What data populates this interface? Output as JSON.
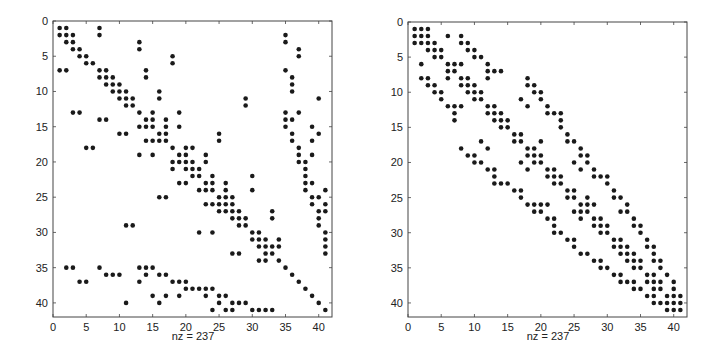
{
  "figure": {
    "background": "#ffffff",
    "ink_color": "#1a1a1a",
    "axis_color": "#444444"
  },
  "chart_data": [
    {
      "type": "scatter",
      "subtype": "sparsity-pattern (spy plot)",
      "title": "",
      "xlabel": "nz = 237",
      "ylabel": "",
      "xlim": [
        0,
        42
      ],
      "ylim": [
        42,
        0
      ],
      "xticks": [
        0,
        5,
        10,
        15,
        20,
        25,
        30,
        35,
        40
      ],
      "yticks": [
        0,
        5,
        10,
        15,
        20,
        25,
        30,
        35,
        40
      ],
      "grid": false,
      "nz": 237,
      "rows": {
        "1": [
          1,
          2,
          7
        ],
        "2": [
          1,
          2,
          3,
          7,
          35
        ],
        "3": [
          2,
          3,
          13,
          35
        ],
        "4": [
          3,
          4,
          13,
          37
        ],
        "5": [
          4,
          5,
          18,
          37
        ],
        "6": [
          5,
          6,
          18
        ],
        "7": [
          1,
          2,
          7,
          8,
          14,
          35
        ],
        "8": [
          7,
          8,
          9,
          14,
          36
        ],
        "9": [
          8,
          9,
          10,
          36
        ],
        "10": [
          9,
          10,
          11,
          16,
          36
        ],
        "11": [
          10,
          11,
          12,
          16,
          29,
          40
        ],
        "12": [
          11,
          12,
          29
        ],
        "13": [
          3,
          4,
          13,
          15,
          19,
          35,
          37
        ],
        "14": [
          7,
          8,
          14,
          15,
          17,
          35,
          36
        ],
        "15": [
          13,
          14,
          15,
          17,
          19,
          35,
          39
        ],
        "16": [
          10,
          11,
          16,
          17,
          25,
          36,
          40
        ],
        "17": [
          14,
          15,
          16,
          17,
          25,
          36,
          39
        ],
        "18": [
          5,
          6,
          18,
          20,
          21,
          37
        ],
        "19": [
          13,
          15,
          19,
          20,
          23,
          37,
          39
        ],
        "20": [
          18,
          19,
          20,
          21,
          23,
          37,
          38
        ],
        "21": [
          18,
          20,
          21,
          22,
          38
        ],
        "22": [
          21,
          22,
          24,
          30,
          38
        ],
        "23": [
          19,
          20,
          23,
          24,
          26,
          38,
          39
        ],
        "24": [
          22,
          23,
          24,
          26,
          30,
          38,
          41
        ],
        "25": [
          16,
          17,
          25,
          26,
          27,
          39,
          40
        ],
        "26": [
          23,
          24,
          25,
          26,
          27,
          39,
          41
        ],
        "27": [
          25,
          26,
          27,
          28,
          33,
          40,
          41
        ],
        "28": [
          27,
          28,
          29,
          33,
          40
        ],
        "29": [
          11,
          12,
          28,
          29,
          40
        ],
        "30": [
          22,
          24,
          30,
          31,
          41
        ],
        "31": [
          30,
          31,
          32,
          34,
          41
        ],
        "32": [
          31,
          32,
          33,
          34,
          41
        ],
        "33": [
          27,
          28,
          32,
          33,
          41
        ],
        "34": [
          31,
          32,
          34
        ],
        "35": [
          2,
          3,
          7,
          13,
          14,
          15,
          35
        ],
        "36": [
          8,
          9,
          10,
          14,
          16,
          17,
          36
        ],
        "37": [
          4,
          5,
          13,
          18,
          19,
          20,
          37
        ],
        "38": [
          20,
          21,
          22,
          23,
          24,
          38
        ],
        "39": [
          15,
          17,
          19,
          23,
          25,
          26,
          39
        ],
        "40": [
          11,
          16,
          25,
          27,
          28,
          29,
          40
        ],
        "41": [
          24,
          26,
          27,
          30,
          31,
          32,
          33,
          41
        ]
      }
    },
    {
      "type": "scatter",
      "subtype": "sparsity-pattern (spy plot)",
      "title": "",
      "xlabel": "nz = 237",
      "ylabel": "",
      "xlim": [
        0,
        42
      ],
      "ylim": [
        42,
        0
      ],
      "xticks": [
        0,
        5,
        10,
        15,
        20,
        25,
        30,
        35,
        40
      ],
      "yticks": [
        0,
        5,
        10,
        15,
        20,
        25,
        30,
        35,
        40
      ],
      "grid": false,
      "nz": 237,
      "rows": {
        "1": [
          1,
          2,
          3
        ],
        "2": [
          1,
          2,
          3,
          6,
          8
        ],
        "3": [
          1,
          2,
          3,
          4,
          8,
          9
        ],
        "4": [
          3,
          4,
          5,
          9,
          10
        ],
        "5": [
          4,
          5,
          10,
          11
        ],
        "6": [
          2,
          6,
          7,
          8,
          12
        ],
        "7": [
          6,
          7,
          12,
          13,
          14
        ],
        "8": [
          2,
          3,
          6,
          8,
          9,
          12,
          18
        ],
        "9": [
          3,
          4,
          8,
          9,
          10,
          18,
          19
        ],
        "10": [
          4,
          5,
          9,
          10,
          11,
          19,
          20
        ],
        "11": [
          5,
          10,
          11,
          17,
          20
        ],
        "12": [
          6,
          7,
          8,
          12,
          13,
          18,
          21
        ],
        "13": [
          7,
          12,
          13,
          14,
          21,
          22,
          23
        ],
        "14": [
          7,
          13,
          14,
          15,
          23
        ],
        "15": [
          14,
          15,
          23
        ],
        "16": [
          16,
          17,
          24
        ],
        "17": [
          11,
          16,
          17,
          20,
          24,
          25
        ],
        "18": [
          8,
          12,
          18,
          19,
          26
        ],
        "19": [
          9,
          10,
          18,
          19,
          20,
          26,
          27
        ],
        "20": [
          10,
          11,
          17,
          19,
          20,
          25,
          27
        ],
        "21": [
          12,
          13,
          18,
          21,
          22,
          26,
          28
        ],
        "22": [
          13,
          21,
          22,
          23,
          28,
          29,
          30
        ],
        "23": [
          13,
          14,
          15,
          22,
          23,
          30
        ],
        "24": [
          16,
          17,
          24,
          25,
          31
        ],
        "25": [
          17,
          24,
          25,
          27,
          31,
          32
        ],
        "26": [
          18,
          19,
          20,
          21,
          26,
          27,
          28,
          33
        ],
        "27": [
          19,
          20,
          25,
          26,
          27,
          32,
          33
        ],
        "28": [
          21,
          22,
          26,
          28,
          29,
          34
        ],
        "29": [
          22,
          28,
          29,
          30,
          34,
          35
        ],
        "30": [
          22,
          23,
          29,
          30,
          35
        ],
        "31": [
          24,
          25,
          31,
          32,
          36
        ],
        "32": [
          25,
          31,
          32,
          33,
          36,
          37
        ],
        "33": [
          26,
          27,
          32,
          33,
          34,
          37
        ],
        "34": [
          28,
          29,
          33,
          34,
          35,
          37,
          38
        ],
        "35": [
          29,
          30,
          34,
          35,
          38
        ],
        "36": [
          31,
          32,
          36,
          37,
          39
        ],
        "37": [
          32,
          33,
          34,
          36,
          37,
          38,
          40
        ],
        "38": [
          34,
          35,
          37,
          38,
          40
        ],
        "39": [
          36,
          37,
          39,
          40,
          41
        ],
        "40": [
          37,
          38,
          39,
          40,
          41
        ],
        "41": [
          39,
          40,
          41
        ]
      }
    }
  ],
  "panels": [
    {
      "xlabel": "nz = 237"
    },
    {
      "xlabel": "nz = 237"
    }
  ]
}
